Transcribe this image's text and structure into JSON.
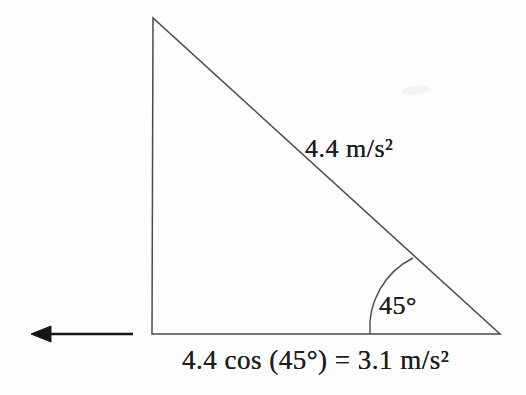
{
  "figure": {
    "hypotenuse_label": "4.4 m/s²",
    "angle_label": "45°",
    "base_label": "4.4 cos (45°) = 3.1 m/s²"
  },
  "colors": {
    "line": "#4b4b4b",
    "text": "#1e1e1e",
    "arrow": "#161616",
    "background": "#fdfdfd"
  }
}
